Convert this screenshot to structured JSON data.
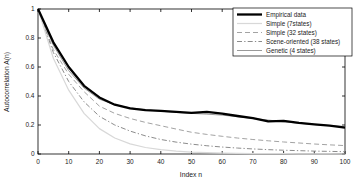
{
  "chart_data": {
    "type": "line",
    "title": "",
    "xlabel": "Index n",
    "ylabel": "Autocorrelation A(n)",
    "xlim": [
      0,
      100
    ],
    "ylim": [
      0,
      1
    ],
    "x_ticks": [
      0,
      10,
      20,
      30,
      40,
      50,
      60,
      70,
      80,
      90,
      100
    ],
    "y_ticks": [
      0,
      0.2,
      0.4,
      0.6,
      0.8,
      1
    ],
    "grid": false,
    "legend_position": "top-right-inside",
    "frame_color": "#000000",
    "x": [
      0,
      5,
      10,
      15,
      20,
      25,
      30,
      35,
      40,
      45,
      50,
      55,
      60,
      65,
      70,
      75,
      80,
      85,
      90,
      95,
      100
    ],
    "series": [
      {
        "name": "Empirical data",
        "color": "#000000",
        "style": "solid",
        "width": 2.3,
        "values": [
          1.0,
          0.77,
          0.6,
          0.47,
          0.39,
          0.34,
          0.315,
          0.302,
          0.298,
          0.29,
          0.283,
          0.29,
          0.278,
          0.262,
          0.248,
          0.225,
          0.228,
          0.215,
          0.205,
          0.195,
          0.182
        ]
      },
      {
        "name": "Simple (7states)",
        "color": "#d8d8d8",
        "style": "solid",
        "width": 1.2,
        "values": [
          1.0,
          0.66,
          0.44,
          0.28,
          0.175,
          0.11,
          0.07,
          0.045,
          0.03,
          0.02,
          0.013,
          0.009,
          0.006,
          0.004,
          0.003,
          0.002,
          0.002,
          0.001,
          0.001,
          0.001,
          0.0
        ]
      },
      {
        "name": "Simple (32 states)",
        "color": "#a3a3a3",
        "style": "dashed",
        "width": 1,
        "values": [
          1.0,
          0.72,
          0.55,
          0.43,
          0.33,
          0.28,
          0.245,
          0.218,
          0.195,
          0.172,
          0.15,
          0.135,
          0.122,
          0.11,
          0.1,
          0.091,
          0.083,
          0.076,
          0.069,
          0.063,
          0.058
        ]
      },
      {
        "name": "Scene-oriented (38 states)",
        "color": "#8c8c8c",
        "style": "dashdot",
        "width": 1,
        "values": [
          1.0,
          0.7,
          0.5,
          0.36,
          0.26,
          0.2,
          0.158,
          0.125,
          0.1,
          0.082,
          0.068,
          0.057,
          0.048,
          0.041,
          0.035,
          0.03,
          0.026,
          0.023,
          0.02,
          0.018,
          0.016
        ]
      },
      {
        "name": "Genetic (4 states)",
        "color": "#999999",
        "style": "solid",
        "width": 1,
        "values": [
          1.0,
          0.75,
          0.575,
          0.455,
          0.378,
          0.34,
          0.318,
          0.305,
          0.295,
          0.287,
          0.28,
          0.275,
          0.268,
          0.257,
          0.245,
          0.234,
          0.222,
          0.212,
          0.203,
          0.196,
          0.19
        ]
      }
    ]
  }
}
